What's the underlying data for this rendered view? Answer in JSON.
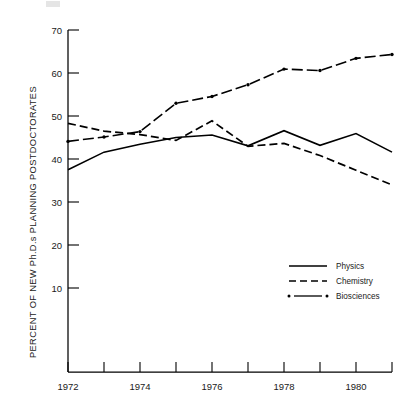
{
  "chart_data": {
    "type": "line",
    "title": "",
    "xlabel": "",
    "ylabel": "PERCENT OF NEW Ph.D.s PLANNING POSTDOCTORATES",
    "x": [
      1972,
      1973,
      1974,
      1975,
      1976,
      1977,
      1978,
      1979,
      1980,
      1981
    ],
    "xlim": [
      1972,
      1981
    ],
    "ylim": [
      0,
      70
    ],
    "xticks": [
      1972,
      1973,
      1974,
      1975,
      1976,
      1977,
      1978,
      1979,
      1980,
      1981
    ],
    "xticklabels": [
      "1972",
      "",
      "1974",
      "",
      "1976",
      "",
      "1978",
      "",
      "1980",
      ""
    ],
    "yticks": [
      10,
      20,
      30,
      40,
      50,
      60,
      70
    ],
    "yticklabels": [
      "10",
      "20",
      "30",
      "40",
      "50",
      "60",
      "70"
    ],
    "grid": false,
    "legend_position": "center-right",
    "series": [
      {
        "name": "Physics",
        "style": "solid",
        "values": [
          41.4,
          45.0,
          46.6,
          48.0,
          48.5,
          46.3,
          49.4,
          46.4,
          48.8,
          45.0
        ]
      },
      {
        "name": "Chemistry",
        "style": "dashed",
        "values": [
          50.9,
          49.3,
          48.6,
          47.4,
          51.4,
          46.2,
          46.8,
          44.3,
          41.3,
          38.3
        ]
      },
      {
        "name": "Biosciences",
        "style": "dash-dot",
        "values": [
          47.2,
          48.1,
          49.2,
          55.0,
          56.4,
          58.8,
          62.0,
          61.7,
          64.2,
          65.0
        ]
      }
    ]
  },
  "legend": {
    "entries": [
      {
        "label": "Physics",
        "swatch": "solid-line-swatch"
      },
      {
        "label": "Chemistry",
        "swatch": "dashed-line-swatch"
      },
      {
        "label": "Biosciences",
        "swatch": "dash-dot-line-swatch"
      }
    ]
  },
  "axes": {
    "y_axis_title": "PERCENT OF NEW Ph.D.s PLANNING POSTDOCTORATES",
    "y_tick_10": "10",
    "y_tick_20": "20",
    "y_tick_30": "30",
    "y_tick_40": "40",
    "y_tick_50": "50",
    "y_tick_60": "60",
    "y_tick_70": "70",
    "x_tick_1972": "1972",
    "x_tick_1974": "1974",
    "x_tick_1976": "1976",
    "x_tick_1978": "1978",
    "x_tick_1980": "1980"
  },
  "colors": {
    "ink": "#000000",
    "background": "#ffffff"
  }
}
